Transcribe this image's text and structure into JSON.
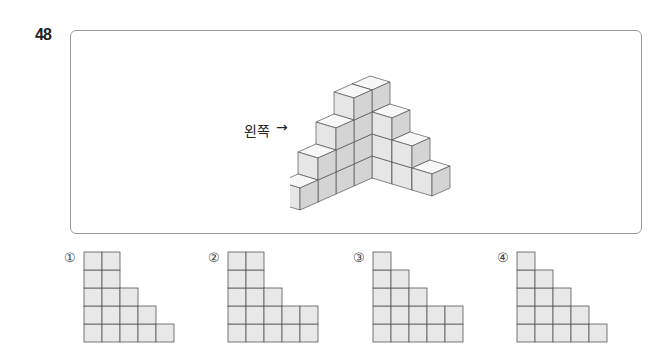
{
  "question": {
    "number": "48",
    "direction_label": "왼쪽",
    "direction_arrow": "→"
  },
  "figure": {
    "left_wing_heights_front_to_back": [
      1,
      2,
      3,
      4
    ],
    "corner_column_height": 4,
    "right_wing_heights_corner_to_right": [
      4,
      3,
      2,
      1
    ],
    "cube_face_colors": {
      "top": "#f7f7f7",
      "left": "#e6e6e6",
      "right": "#d4d4d4",
      "edge": "#555555"
    }
  },
  "options": [
    {
      "mark": "①",
      "column_heights": [
        5,
        5,
        3,
        2,
        1
      ]
    },
    {
      "mark": "②",
      "column_heights": [
        5,
        5,
        3,
        2,
        2
      ]
    },
    {
      "mark": "③",
      "column_heights": [
        5,
        4,
        3,
        2,
        2
      ]
    },
    {
      "mark": "④",
      "column_heights": [
        5,
        4,
        3,
        2,
        1
      ]
    }
  ],
  "colors": {
    "grid_fill": "#e8e8e8",
    "grid_line": "#555555",
    "box_border": "#9a9a9a"
  }
}
